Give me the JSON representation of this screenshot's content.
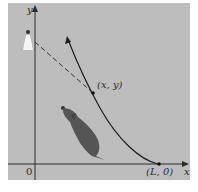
{
  "diagram": {
    "type": "pursuit-curve",
    "colors": {
      "panel": "#bdbdbd",
      "background": "#ffffff",
      "axis": "#2a2a2a",
      "curve": "#1e1e1e",
      "dog": "#555555",
      "person": "#f4f4f4"
    },
    "axes": {
      "x_label": "x",
      "y_label": "y",
      "origin_label": "0"
    },
    "points": [
      {
        "name": "current-position",
        "label": "(x, y)"
      },
      {
        "name": "start-point",
        "label": "(L, 0)"
      }
    ],
    "elements": {
      "person": "person-figure-on-y-axis",
      "dog": "dog-figure-chasing",
      "tangent": "dashed-tangent-line",
      "curve": "pursuit-curve-with-arrow"
    }
  }
}
